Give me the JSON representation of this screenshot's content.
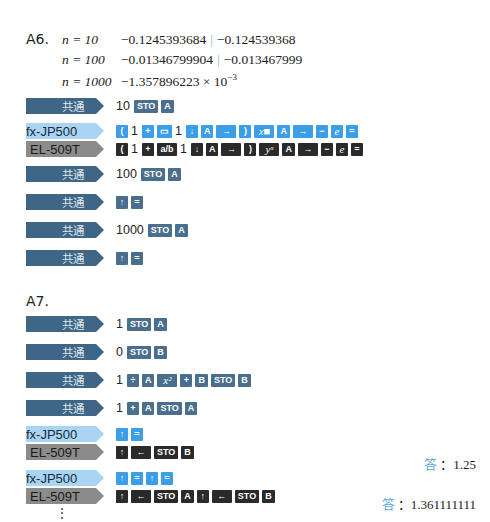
{
  "a6": {
    "label": "A6.",
    "lines": [
      {
        "n": "n = 10",
        "value": "−0.1245393684",
        "alt": "−0.124539368"
      },
      {
        "n": "n = 100",
        "value": "−0.01346799904",
        "alt": "−0.013467999"
      },
      {
        "n": "n = 1000",
        "value": "−1.357896223 × 10",
        "exp": "−3"
      }
    ],
    "steps": [
      {
        "type": "common",
        "tag": "共通",
        "keys": [
          {
            "n": "10"
          },
          {
            "k": "STO"
          },
          {
            "k": "A"
          }
        ]
      },
      {
        "type": "fx",
        "tag": "fx-JP500",
        "keys": [
          {
            "k": "("
          },
          {
            "n": "1"
          },
          {
            "k": "+"
          },
          {
            "k": "▭"
          },
          {
            "n": "1"
          },
          {
            "k": "↓"
          },
          {
            "k": "A"
          },
          {
            "k": "→",
            "w": 1
          },
          {
            "k": ")"
          },
          {
            "k": "x■",
            "w": 1,
            "it": 1
          },
          {
            "k": "A"
          },
          {
            "k": "→",
            "w": 1
          },
          {
            "k": "−"
          },
          {
            "k": "e",
            "it": 1
          },
          {
            "k": "="
          }
        ]
      },
      {
        "type": "el",
        "tag": "EL-509T",
        "keys": [
          {
            "k": "("
          },
          {
            "n": "1"
          },
          {
            "k": "+"
          },
          {
            "k": "a/b",
            "w": 1
          },
          {
            "n": "1"
          },
          {
            "k": "↓"
          },
          {
            "k": "A"
          },
          {
            "k": "→",
            "w": 1
          },
          {
            "k": ")"
          },
          {
            "k": "yˣ",
            "w": 1,
            "it": 1
          },
          {
            "k": "A"
          },
          {
            "k": "→",
            "w": 1
          },
          {
            "k": "−"
          },
          {
            "k": "e",
            "it": 1
          },
          {
            "k": "="
          }
        ]
      },
      {
        "type": "common",
        "tag": "共通",
        "keys": [
          {
            "n": "100"
          },
          {
            "k": "STO"
          },
          {
            "k": "A"
          }
        ]
      },
      {
        "type": "common",
        "tag": "共通",
        "keys": [
          {
            "k": "↑"
          },
          {
            "k": "="
          }
        ]
      },
      {
        "type": "common",
        "tag": "共通",
        "keys": [
          {
            "n": "1000"
          },
          {
            "k": "STO"
          },
          {
            "k": "A"
          }
        ]
      },
      {
        "type": "common",
        "tag": "共通",
        "keys": [
          {
            "k": "↑"
          },
          {
            "k": "="
          }
        ]
      }
    ]
  },
  "a7": {
    "label": "A7.",
    "steps": [
      {
        "type": "common",
        "tag": "共通",
        "keys": [
          {
            "n": "1"
          },
          {
            "k": "STO"
          },
          {
            "k": "A"
          }
        ]
      },
      {
        "type": "common",
        "tag": "共通",
        "keys": [
          {
            "n": "0"
          },
          {
            "k": "STO"
          },
          {
            "k": "B"
          }
        ]
      },
      {
        "type": "common",
        "tag": "共通",
        "keys": [
          {
            "n": "1"
          },
          {
            "k": "÷"
          },
          {
            "k": "A"
          },
          {
            "k": "x²",
            "w": 1,
            "it": 1
          },
          {
            "k": "+"
          },
          {
            "k": "B"
          },
          {
            "k": "STO"
          },
          {
            "k": "B"
          }
        ]
      },
      {
        "type": "common",
        "tag": "共通",
        "keys": [
          {
            "n": "1"
          },
          {
            "k": "+"
          },
          {
            "k": "A"
          },
          {
            "k": "STO"
          },
          {
            "k": "A"
          }
        ]
      },
      {
        "type": "fx",
        "tag": "fx-JP500",
        "keys": [
          {
            "k": "↑"
          },
          {
            "k": "="
          }
        ]
      },
      {
        "type": "el",
        "tag": "EL-509T",
        "keys": [
          {
            "k": "↑"
          },
          {
            "k": "←",
            "w": 1
          },
          {
            "k": "STO"
          },
          {
            "k": "B"
          }
        ]
      },
      {
        "type": "fx",
        "tag": "fx-JP500",
        "keys": [
          {
            "k": "↑"
          },
          {
            "k": "="
          },
          {
            "k": "↑"
          },
          {
            "k": "="
          }
        ]
      },
      {
        "type": "el",
        "tag": "EL-509T",
        "keys": [
          {
            "k": "↑"
          },
          {
            "k": "←",
            "w": 1
          },
          {
            "k": "STO"
          },
          {
            "k": "A"
          },
          {
            "k": "↑"
          },
          {
            "k": "←",
            "w": 1
          },
          {
            "k": "STO"
          },
          {
            "k": "B"
          }
        ]
      }
    ],
    "answers": [
      {
        "label": "答",
        "value": "：1.25"
      },
      {
        "label": "答",
        "value": "：1.361111111"
      }
    ],
    "continuation": "⋮"
  }
}
